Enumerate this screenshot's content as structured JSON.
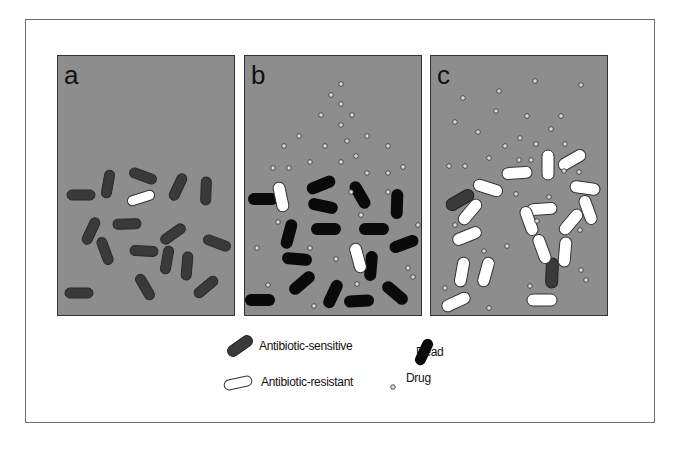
{
  "figure": {
    "panels": [
      {
        "id": "a",
        "label": "a"
      },
      {
        "id": "b",
        "label": "b"
      },
      {
        "id": "c",
        "label": "c"
      }
    ]
  },
  "legend": {
    "items": [
      {
        "key": "sensitive",
        "label": "Antibiotic-sensitive",
        "color": "#3a3a3a"
      },
      {
        "key": "dead",
        "label": "Dead",
        "color": "#0a0a0a"
      },
      {
        "key": "resistant",
        "label": "Antibiotic-resistant",
        "color": "#ffffff"
      },
      {
        "key": "drug",
        "label": "Drug",
        "color": "#d8d8d8"
      }
    ]
  },
  "colors": {
    "panel_bg": "#8d8d8d",
    "sensitive": "#3a3a3a",
    "dead": "#0a0a0a",
    "resistant": "#ffffff",
    "drug": "#d8d8d8"
  }
}
